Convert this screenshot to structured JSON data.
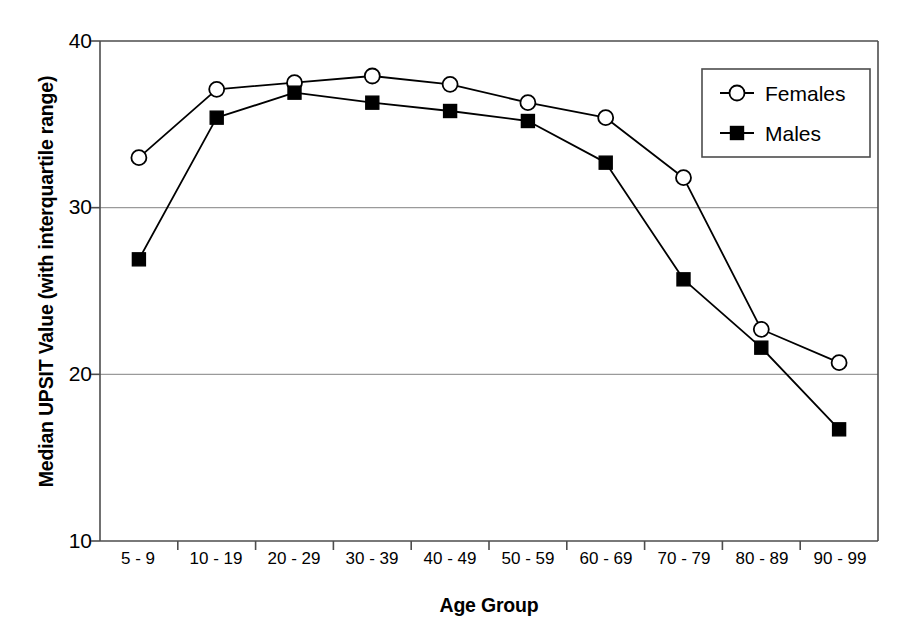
{
  "chart_data": {
    "type": "line",
    "title": "",
    "xlabel": "Age Group",
    "ylabel": "Median UPSIT Value (with interquartile range)",
    "categories": [
      "5 - 9",
      "10 - 19",
      "20 - 29",
      "30 - 39",
      "40 - 49",
      "50 - 59",
      "60 - 69",
      "70 - 79",
      "80 - 89",
      "90 - 99"
    ],
    "ylim": [
      10,
      40
    ],
    "yticks": [
      10,
      20,
      30,
      40
    ],
    "ytick_labels": [
      "10",
      "20",
      "30",
      "40"
    ],
    "grid": "horizontal",
    "legend_position": "top-right",
    "series": [
      {
        "name": "Females",
        "marker": "open-circle",
        "color": "#000000",
        "values": [
          33.0,
          37.1,
          37.5,
          37.9,
          37.4,
          36.3,
          35.4,
          31.8,
          22.7,
          20.7
        ]
      },
      {
        "name": "Males",
        "marker": "filled-square",
        "color": "#000000",
        "values": [
          26.9,
          35.4,
          36.9,
          36.3,
          35.8,
          35.2,
          32.7,
          25.7,
          21.6,
          16.7
        ]
      }
    ]
  },
  "legend": {
    "entries": [
      {
        "label": "Females",
        "marker": "open-circle"
      },
      {
        "label": "Males",
        "marker": "filled-square"
      }
    ]
  },
  "axes": {
    "y_title": "Median UPSIT Value (with interquartile range)",
    "x_title": "Age Group"
  },
  "colors": {
    "axis": "#4d4d4d",
    "grid": "#9a9a9a",
    "series": "#000000",
    "background": "#ffffff"
  }
}
